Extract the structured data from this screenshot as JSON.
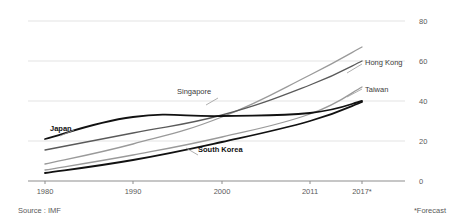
{
  "chart_data": {
    "type": "line",
    "title": "",
    "subtitle": "",
    "xlabel": "",
    "ylabel": "",
    "x": [
      1980,
      1990,
      2000,
      2011,
      2017
    ],
    "xtick_labels": [
      "1980",
      "1990",
      "2000",
      "2011",
      "2017*"
    ],
    "ytick_labels": [
      "0",
      "20",
      "40",
      "60",
      "80"
    ],
    "yticks": [
      0,
      20,
      40,
      60,
      80
    ],
    "ylim": [
      0,
      80
    ],
    "xlim": [
      1980,
      2017
    ],
    "grid": "horizontal",
    "legend": "inline-labels",
    "series": [
      {
        "name": "Singapore",
        "color": "#9a9a9a",
        "width": 1.3,
        "bold_label": false,
        "values": [
          8.5,
          18.5,
          32.0,
          53.0,
          67.0
        ]
      },
      {
        "name": "Hong Kong",
        "color": "#5a5a5a",
        "width": 1.3,
        "bold_label": false,
        "values": [
          15.5,
          24.0,
          33.0,
          48.0,
          60.0
        ]
      },
      {
        "name": "Taiwan",
        "color": "#9a9a9a",
        "width": 1.3,
        "bold_label": false,
        "values": [
          5.5,
          13.0,
          22.0,
          33.5,
          47.0
        ]
      },
      {
        "name": "Japan",
        "color": "#111111",
        "width": 1.8,
        "bold_label": true,
        "values": [
          21.0,
          32.0,
          32.5,
          34.0,
          40.0
        ]
      },
      {
        "name": "South Korea",
        "color": "#111111",
        "width": 1.8,
        "bold_label": true,
        "values": [
          4.0,
          10.5,
          19.5,
          30.0,
          39.5
        ]
      }
    ],
    "annotations": [
      {
        "text": "Singapore",
        "x": 177,
        "y": 94,
        "bold": false
      },
      {
        "text": "Hong Kong",
        "x": 365,
        "y": 65,
        "bold": false
      },
      {
        "text": "Taiwan",
        "x": 365,
        "y": 92,
        "bold": false
      },
      {
        "text": "Japan",
        "x": 50,
        "y": 131,
        "bold": true
      },
      {
        "text": "South Korea",
        "x": 198,
        "y": 152,
        "bold": true
      }
    ]
  },
  "footnotes": {
    "source": "Source : IMF",
    "forecast": "*Forecast"
  }
}
